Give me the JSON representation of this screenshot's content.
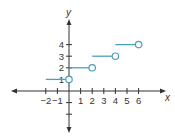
{
  "chart_data": {
    "type": "line",
    "title": "",
    "xlabel": "x",
    "ylabel": "y",
    "xlim": [
      -2,
      6
    ],
    "ylim": [
      -3,
      4
    ],
    "grid": false,
    "x_ticks": [
      -2,
      -1,
      1,
      2,
      3,
      4,
      5,
      6
    ],
    "x_tick_labels": [
      "−2",
      "−1",
      "1",
      "2",
      "3",
      "4",
      "5",
      "6"
    ],
    "y_ticks": [
      1,
      2,
      3,
      4
    ],
    "y_tick_labels": [
      "1",
      "2",
      "3",
      "4"
    ],
    "y_minor_ticks_unlabeled": [
      -1,
      -2
    ],
    "series": [
      {
        "name": "step function",
        "style": "horizontal segments, closed left end, open circle right end",
        "segments": [
          {
            "x_start": -2,
            "x_end": 0,
            "y": 1,
            "start_closed": true,
            "end_open": true
          },
          {
            "x_start": 0,
            "x_end": 2,
            "y": 2,
            "start_closed": true,
            "end_open": true
          },
          {
            "x_start": 2,
            "x_end": 4,
            "y": 3,
            "start_closed": true,
            "end_open": true
          },
          {
            "x_start": 4,
            "x_end": 6,
            "y": 4,
            "start_closed": true,
            "end_open": true
          }
        ]
      }
    ]
  },
  "colors": {
    "axis": "#333333",
    "series": "#4a9fb8",
    "background": "#ffffff"
  },
  "labels": {
    "x_axis": "x",
    "y_axis": "y"
  }
}
